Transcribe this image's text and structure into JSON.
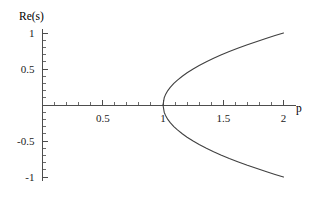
{
  "chart_data": {
    "type": "line",
    "title": "",
    "subtitle": "",
    "xlabel": "p",
    "ylabel": "Re(s)",
    "xlim": [
      0,
      2.05
    ],
    "ylim": [
      -1.05,
      1.05
    ],
    "grid": false,
    "legend": null,
    "xticks": [
      0.5,
      1,
      1.5,
      2
    ],
    "xticklabels": [
      "0.5",
      "1",
      "1.5",
      "2"
    ],
    "yticks": [
      1,
      0.5,
      -0.5,
      -1
    ],
    "yticklabels": [
      "1",
      "0.5",
      "-0.5",
      "-1"
    ],
    "x_minor_step": 0.1,
    "y_minor_step": 0.1,
    "annotations": [],
    "series": [
      {
        "name": "upper-branch",
        "equation": "Re(s) = sqrt(p - 1)",
        "x": [
          1.0,
          1.01,
          1.02,
          1.04,
          1.06,
          1.09,
          1.12,
          1.16,
          1.2,
          1.25,
          1.3,
          1.36,
          1.42,
          1.48,
          1.55,
          1.62,
          1.7,
          1.78,
          1.86,
          1.93,
          2.0
        ],
        "y": [
          0.0,
          0.1,
          0.141,
          0.2,
          0.245,
          0.3,
          0.346,
          0.4,
          0.447,
          0.5,
          0.548,
          0.6,
          0.648,
          0.693,
          0.742,
          0.787,
          0.837,
          0.883,
          0.927,
          0.964,
          1.0
        ]
      },
      {
        "name": "lower-branch",
        "equation": "Re(s) = -sqrt(p - 1)",
        "x": [
          1.0,
          1.01,
          1.02,
          1.04,
          1.06,
          1.09,
          1.12,
          1.16,
          1.2,
          1.25,
          1.3,
          1.36,
          1.42,
          1.48,
          1.55,
          1.62,
          1.7,
          1.78,
          1.86,
          1.93,
          2.0
        ],
        "y": [
          0.0,
          -0.1,
          -0.141,
          -0.2,
          -0.245,
          -0.3,
          -0.346,
          -0.4,
          -0.447,
          -0.5,
          -0.548,
          -0.6,
          -0.648,
          -0.693,
          -0.742,
          -0.787,
          -0.837,
          -0.883,
          -0.927,
          -0.964,
          -1.0
        ]
      }
    ],
    "colors": {
      "curve": "#404040",
      "axis": "#4d4d4d",
      "text": "#1a1a1a",
      "background": "#ffffff"
    }
  },
  "labels": {
    "y_axis_title_prefix": "Re(",
    "y_axis_title_var": "s",
    "y_axis_title_suffix": ")",
    "x_axis_title": "p"
  }
}
